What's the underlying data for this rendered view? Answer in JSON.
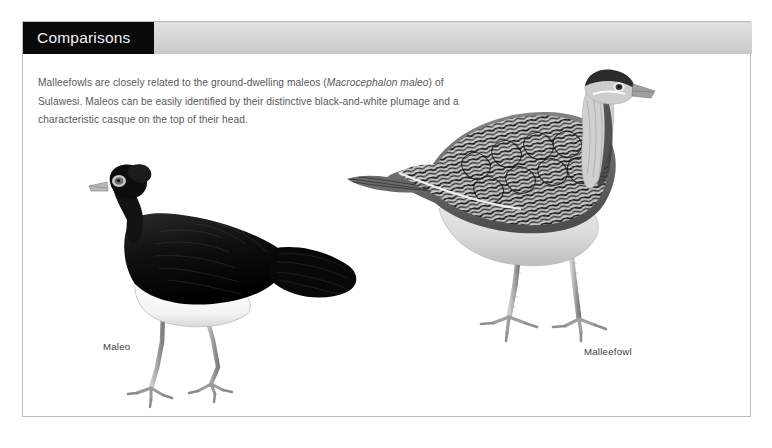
{
  "header": {
    "title": "Comparisons",
    "title_block_color": "#0a0a0a",
    "bar_color": "#d6d6d6"
  },
  "intro": {
    "text_part1": "Malleefowls are closely related to the ground-dwelling maleos (",
    "scientific_name": "Macrocephalon maleo",
    "text_part2": ") of Sulawesi. Maleos can be easily identified by their distinctive black-and-white plumage and a characteristic casque on the top of their head.",
    "text_color": "#58585a"
  },
  "figures": [
    {
      "caption": "Maleo",
      "description": "black-plumaged ground bird with bulbous head casque and white belly"
    },
    {
      "caption": "Malleefowl",
      "description": "mottled barred-plumage ground bird with pale breast and long grey legs"
    }
  ],
  "panel": {
    "border_color": "#bdbdbd",
    "background_color": "#ffffff"
  }
}
